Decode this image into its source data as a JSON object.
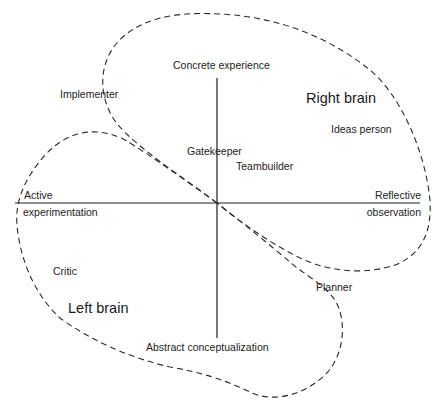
{
  "diagram": {
    "axes": {
      "top": "Concrete experience",
      "bottom": "Abstract conceptualization",
      "left_line1": "Active",
      "left_line2": "experimentation",
      "right_line1": "Reflective",
      "right_line2": "observation"
    },
    "regions": {
      "right": "Right brain",
      "left": "Left brain"
    },
    "roles": {
      "implementer": "Implementer",
      "ideas_person": "Ideas person",
      "gatekeeper": "Gatekeeper",
      "teambuilder": "Teambuilder",
      "critic": "Critic",
      "planner": "Planner"
    },
    "colors": {
      "line": "#1e1e1e",
      "background": "#ffffff"
    }
  }
}
